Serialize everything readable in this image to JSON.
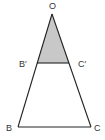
{
  "diagram": {
    "type": "similar-triangles",
    "labels": {
      "apex": "O",
      "mid_left": "B′",
      "mid_right": "C′",
      "base_left": "B",
      "base_right": "C"
    },
    "colors": {
      "stroke": "#222222",
      "shaded_fill": "#c8c8c8",
      "background": "#ffffff"
    },
    "shaded_region": "triangle OB′C′"
  }
}
